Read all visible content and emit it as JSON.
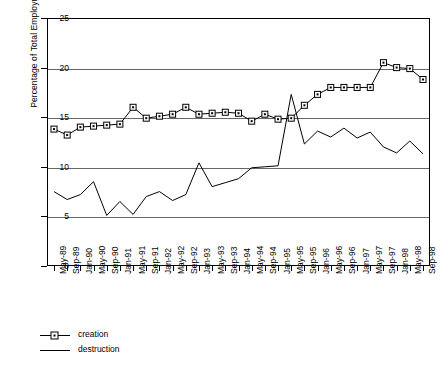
{
  "chart_data": {
    "type": "line",
    "title": "",
    "xlabel": "",
    "ylabel": "Percentage of Total Employment",
    "ylim": [
      0,
      25
    ],
    "yticks": [
      0,
      5,
      10,
      15,
      20,
      25
    ],
    "grid": true,
    "legend_position": "bottom-left",
    "categories": [
      "May-89",
      "Sep-89",
      "Jan-90",
      "May-90",
      "Sep-90",
      "Jan-91",
      "May-91",
      "Sep-91",
      "Jan-92",
      "May-92",
      "Sep-92",
      "Jan-93",
      "May-93",
      "Sep-93",
      "Jan-94",
      "May-94",
      "Sep-94",
      "Jan-95",
      "May-95",
      "Sep-95",
      "Jan-96",
      "May-96",
      "Sep-96",
      "Jan-97",
      "May-97",
      "Sep-97",
      "Jan-98",
      "May-98",
      "Sep-98"
    ],
    "series": [
      {
        "name": "creation",
        "marker": "square",
        "values": [
          13.8,
          13.2,
          14.0,
          14.1,
          14.2,
          14.3,
          16.0,
          14.9,
          15.1,
          15.3,
          16.0,
          15.3,
          15.4,
          15.5,
          15.4,
          14.6,
          15.3,
          14.8,
          14.9,
          16.2,
          17.3,
          18.0,
          18.0,
          18.0,
          18.0,
          20.5,
          20.0,
          19.9,
          18.8
        ]
      },
      {
        "name": "destruction",
        "marker": "none",
        "values": [
          7.5,
          6.7,
          7.2,
          8.5,
          5.1,
          6.5,
          5.2,
          7.0,
          7.5,
          6.6,
          7.2,
          10.4,
          8.0,
          8.4,
          8.8,
          9.9,
          10.0,
          10.1,
          17.3,
          12.3,
          13.6,
          13.0,
          13.9,
          12.9,
          13.5,
          12.0,
          11.4,
          12.6,
          11.3
        ]
      }
    ]
  },
  "legend": {
    "items": [
      {
        "label": "creation"
      },
      {
        "label": "destruction"
      }
    ]
  },
  "axis": {
    "y_title": "Percentage of Total Employment"
  },
  "colors": {
    "line": "#000000",
    "grid": "#666666",
    "background": "#ffffff"
  }
}
